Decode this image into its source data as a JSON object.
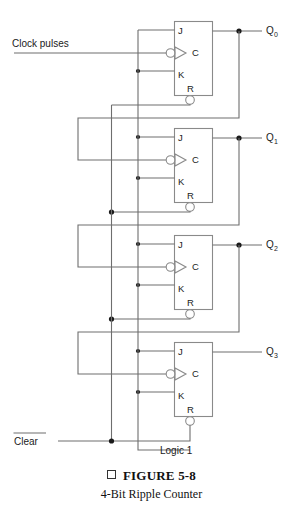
{
  "figure": {
    "bullet_icon": "square-bullet-icon",
    "caption_title": "FIGURE 5-8",
    "caption_subtitle": "4-Bit Ripple Counter"
  },
  "diagram": {
    "type": "logic-schematic",
    "colors": {
      "wire": "#6e6e6e",
      "box": "#8a8a8a",
      "junction_dot": "#1a1a1a",
      "text": "#1a1a1a",
      "background": "#ffffff"
    },
    "input_labels": [
      {
        "name": "clock-pulses-label",
        "text": "Clock pulses"
      },
      {
        "name": "clear-label",
        "text": "Clear",
        "overbar": true
      },
      {
        "name": "logic1-label",
        "text": "Logic 1"
      }
    ],
    "output_labels": [
      {
        "name": "output-q0",
        "base": "Q",
        "subscript": "0"
      },
      {
        "name": "output-q1",
        "base": "Q",
        "subscript": "1"
      },
      {
        "name": "output-q2",
        "base": "Q",
        "subscript": "2"
      },
      {
        "name": "output-q3",
        "base": "Q",
        "subscript": "3"
      }
    ],
    "flipflops": [
      {
        "name": "flipflop-0",
        "output": "Q0",
        "pins": [
          "J",
          "C",
          "K",
          "R"
        ]
      },
      {
        "name": "flipflop-1",
        "output": "Q1",
        "pins": [
          "J",
          "C",
          "K",
          "R"
        ]
      },
      {
        "name": "flipflop-2",
        "output": "Q2",
        "pins": [
          "J",
          "C",
          "K",
          "R"
        ]
      },
      {
        "name": "flipflop-3",
        "output": "Q3",
        "pins": [
          "J",
          "C",
          "K",
          "R"
        ]
      }
    ],
    "pin_names": {
      "j": "J",
      "c": "C",
      "k": "K",
      "r": "R"
    }
  }
}
